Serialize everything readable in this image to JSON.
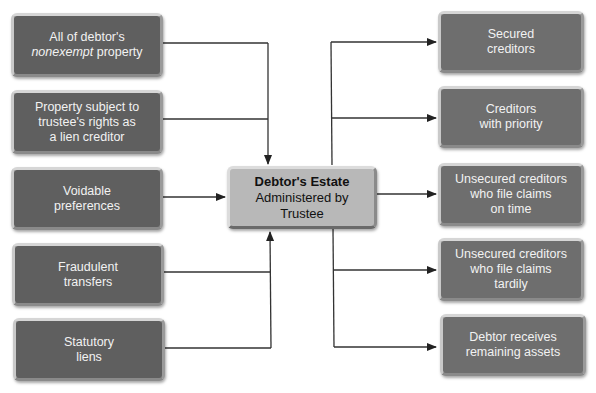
{
  "diagram": {
    "center": {
      "title": "Debtor's Estate",
      "line2": "Administered by",
      "line3": "Trustee"
    },
    "sources": [
      {
        "line1": "All of debtor's",
        "line2_em": "nonexempt",
        "line2_rest": " property"
      },
      {
        "line1": "Property subject to",
        "line2": "trustee's rights as",
        "line3": "a lien creditor"
      },
      {
        "line1": "Voidable",
        "line2": "preferences"
      },
      {
        "line1": "Fraudulent",
        "line2": "transfers"
      },
      {
        "line1": "Statutory",
        "line2": "liens"
      }
    ],
    "distributions": [
      {
        "line1": "Secured",
        "line2": "creditors"
      },
      {
        "line1": "Creditors",
        "line2": "with priority"
      },
      {
        "line1": "Unsecured creditors",
        "line2": "who file claims",
        "line3": "on time"
      },
      {
        "line1": "Unsecured creditors",
        "line2": "who file claims",
        "line3": "tardily"
      },
      {
        "line1": "Debtor receives",
        "line2": "remaining assets"
      }
    ],
    "colors": {
      "source_box": "#5f5f5f",
      "distribution_box": "#6e6e6e",
      "center_box": "#b8b8b8",
      "connector": "#222222"
    }
  }
}
